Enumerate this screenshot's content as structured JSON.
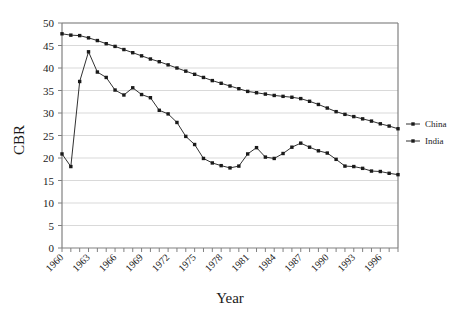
{
  "chart_data": {
    "type": "line",
    "title": "",
    "xlabel": "Year",
    "ylabel": "CBR",
    "xlim": [
      1960,
      1998
    ],
    "ylim": [
      0,
      50
    ],
    "ytick_step": 5,
    "yticks": [
      0,
      5,
      10,
      15,
      20,
      25,
      30,
      35,
      40,
      45,
      50
    ],
    "xticks": [
      1960,
      1963,
      1966,
      1969,
      1972,
      1975,
      1978,
      1981,
      1984,
      1987,
      1990,
      1993,
      1996
    ],
    "xtick_labels": [
      "1960",
      "1963",
      "1966",
      "1969",
      "1972",
      "1975",
      "1978",
      "1981",
      "1984",
      "1987",
      "1990",
      "1993",
      "1996"
    ],
    "xtick_rotation_deg": -45,
    "grid": "horizontal",
    "legend_position": "right",
    "marker": "square",
    "line_color": "#1a1a1a",
    "grid_color": "#d9d9d9",
    "axis_color": "#808080",
    "x": [
      1960,
      1961,
      1962,
      1963,
      1964,
      1965,
      1966,
      1967,
      1968,
      1969,
      1970,
      1971,
      1972,
      1973,
      1974,
      1975,
      1976,
      1977,
      1978,
      1979,
      1980,
      1981,
      1982,
      1983,
      1984,
      1985,
      1986,
      1987,
      1988,
      1989,
      1990,
      1991,
      1992,
      1993,
      1994,
      1995,
      1996,
      1997,
      1998
    ],
    "series": [
      {
        "name": "China",
        "values": [
          20.9,
          18.1,
          37.0,
          43.6,
          39.1,
          37.9,
          35.1,
          34.0,
          35.6,
          34.1,
          33.4,
          30.6,
          29.8,
          27.9,
          24.8,
          23.0,
          19.9,
          18.9,
          18.3,
          17.8,
          18.2,
          20.9,
          22.3,
          20.2,
          19.9,
          21.0,
          22.4,
          23.3,
          22.4,
          21.6,
          21.1,
          19.7,
          18.2,
          18.1,
          17.7,
          17.1,
          17.0,
          16.6,
          16.3
        ]
      },
      {
        "name": "India",
        "values": [
          47.6,
          47.3,
          47.2,
          46.7,
          46.1,
          45.4,
          44.8,
          44.1,
          43.4,
          42.7,
          42.0,
          41.4,
          40.7,
          40.0,
          39.3,
          38.6,
          37.9,
          37.2,
          36.6,
          36.0,
          35.4,
          34.8,
          34.5,
          34.2,
          33.9,
          33.7,
          33.5,
          33.2,
          32.6,
          31.9,
          31.1,
          30.3,
          29.7,
          29.2,
          28.7,
          28.2,
          27.6,
          27.1,
          26.5
        ]
      }
    ]
  },
  "legend": {
    "entries": [
      {
        "label": "China"
      },
      {
        "label": "India"
      }
    ]
  },
  "axes": {
    "y_title": "CBR",
    "x_title": "Year"
  }
}
